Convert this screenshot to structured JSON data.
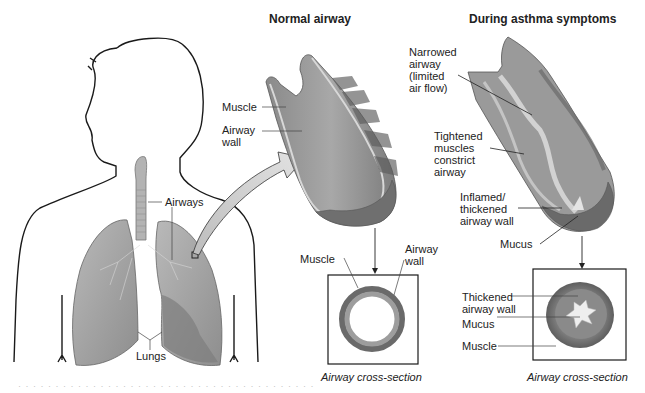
{
  "titles": {
    "normal": "Normal airway",
    "asthma": "During asthma symptoms"
  },
  "body_labels": {
    "airways": "Airways",
    "lungs": "Lungs"
  },
  "normal_labels": {
    "muscle": "Muscle",
    "airway_wall": "Airway\nwall",
    "cs_muscle": "Muscle",
    "cs_airway_wall": "Airway\nwall",
    "caption": "Airway cross-section"
  },
  "asthma_labels": {
    "narrowed": "Narrowed\nairway\n(limited\nair flow)",
    "tightened": "Tightened\nmuscles\nconstrict\nairway",
    "inflamed": "Inflamed/\nthickened\nairway wall",
    "mucus": "Mucus",
    "cs_thickened": "Thickened\nairway wall",
    "cs_mucus": "Mucus",
    "cs_muscle": "Muscle",
    "caption": "Airway cross-section"
  },
  "footer": "· · · · · · · · · · · · · · · · · · · · · · · · · · · · · · · · · · · · · · · ·",
  "colors": {
    "tissue_dark": "#6f6f6f",
    "tissue_mid": "#9a9a9a",
    "tissue_light": "#c8c8c8",
    "outline": "#1a1a1a"
  }
}
